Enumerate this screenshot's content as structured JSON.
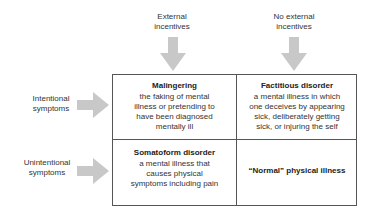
{
  "columns": [
    {
      "label_line1": "External",
      "label_line2": "incentives"
    },
    {
      "label_line1": "No external",
      "label_line2": "incentives"
    }
  ],
  "rows": [
    {
      "label_line1": "Intentional",
      "label_line2": "symptoms"
    },
    {
      "label_line1": "Unintentional",
      "label_line2": "symptoms"
    }
  ],
  "cells": {
    "top_left": {
      "title": "Malingering",
      "desc_lines": [
        "the faking of mental",
        "illness or pretending to",
        "have been diagnosed",
        "mentally ill"
      ]
    },
    "top_right": {
      "title": "Factitious disorder",
      "desc_lines": [
        "a mental illness in which",
        "one deceives by appearing",
        "sick, deliberately getting",
        "sick, or injuring the self"
      ]
    },
    "bottom_left": {
      "title": "Somatoform disorder",
      "desc_lines": [
        "a mental illness that",
        "causes physical",
        "symptoms including pain"
      ]
    },
    "bottom_right": {
      "title": "“Normal” physical illness"
    }
  },
  "colors": {
    "arrow": "#c8c8c8",
    "border": "#555555"
  }
}
